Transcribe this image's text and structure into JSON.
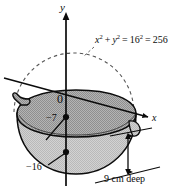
{
  "figure": {
    "kind": "math-diagram",
    "axes": {
      "y_axis_label": "y",
      "x_axis_label": "x",
      "origin_label": "0"
    },
    "annotations": {
      "equation_full": "x² + y² = 16² = 256",
      "equation_parts": {
        "x_var": "x",
        "y_var": "y",
        "exp_two": "2",
        "plus": "+",
        "equals": "=",
        "radius": "16",
        "result": "256"
      },
      "water_level_label": "−7",
      "bowl_bottom_label": "−16",
      "depth_label": "9 cm deep"
    },
    "colors": {
      "stroke": "#0b0b0b",
      "upper_fill": "#a8a8a8",
      "lower_fill": "#c9c9c9",
      "background": "#ffffff",
      "dashed_stroke": "#444444"
    }
  }
}
